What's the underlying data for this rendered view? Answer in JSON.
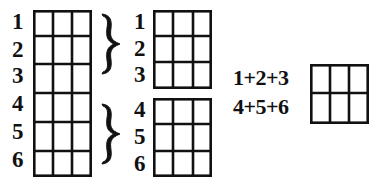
{
  "diagram": {
    "stroke_color": "#111111",
    "background": "#ffffff",
    "left_grid": {
      "rows": 6,
      "cols": 3,
      "row_labels": [
        "1",
        "2",
        "3",
        "4",
        "5",
        "6"
      ]
    },
    "braces": [
      {
        "groups_rows": [
          "1",
          "2",
          "3"
        ]
      },
      {
        "groups_rows": [
          "4",
          "5",
          "6"
        ]
      }
    ],
    "middle_top_grid": {
      "rows": 3,
      "cols": 3,
      "row_labels": [
        "1",
        "2",
        "3"
      ]
    },
    "middle_bottom_grid": {
      "rows": 3,
      "cols": 3,
      "row_labels": [
        "4",
        "5",
        "6"
      ]
    },
    "right_grid": {
      "rows": 2,
      "cols": 3,
      "row_labels": [
        "1+2+3",
        "4+5+6"
      ]
    }
  }
}
